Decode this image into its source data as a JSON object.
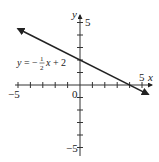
{
  "chart_data": {
    "type": "line",
    "title": "",
    "xlabel": "x",
    "ylabel": "y",
    "xlim": [
      -5,
      5
    ],
    "ylim": [
      -5,
      5
    ],
    "grid": false,
    "x_ticks": [
      -5,
      -4,
      -3,
      -2,
      -1,
      0,
      1,
      2,
      3,
      4,
      5
    ],
    "y_ticks": [
      -5,
      -4,
      -3,
      -2,
      -1,
      0,
      1,
      2,
      3,
      4,
      5
    ],
    "tick_labels": {
      "x_min": "−5",
      "x_max": "5",
      "y_max": "5",
      "y_min": "−5",
      "origin": "0"
    },
    "series": [
      {
        "name": "y = −½x + 2",
        "equation": "y = -1/2 x + 2",
        "slope": -0.5,
        "intercept": 2,
        "x": [
          -5,
          5.5
        ],
        "y": [
          4.5,
          -0.75
        ],
        "arrows": "both"
      }
    ],
    "annotations": [
      {
        "text": "y = −½x + 2",
        "x": -4,
        "y": 2
      }
    ],
    "color": "#222222"
  },
  "labels": {
    "x_axis": "x",
    "y_axis": "y",
    "x_min": "−5",
    "x_max": "5",
    "y_max": "5",
    "y_min": "−5",
    "origin": "0",
    "eq_prefix": "y = −",
    "eq_num": "1",
    "eq_den": "2",
    "eq_suffix": "x + 2"
  }
}
